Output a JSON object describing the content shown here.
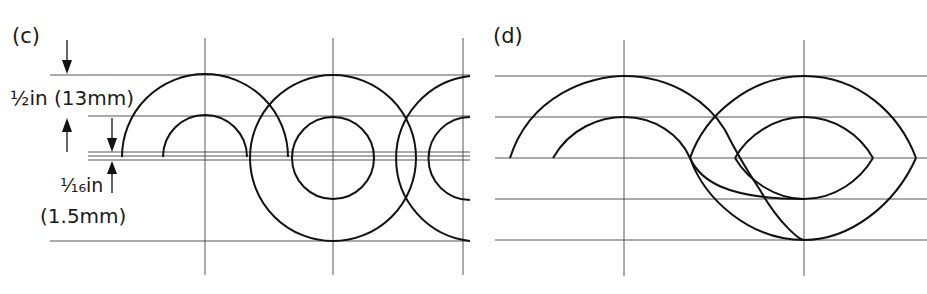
{
  "panels": [
    {
      "id": "c",
      "label": "(c)",
      "dimensions": [
        {
          "label": "½in (13mm)",
          "meaning": "height between guidelines"
        },
        {
          "label_line1": "¹⁄₁₆in",
          "label_line2": "(1.5mm)",
          "meaning": "small gap between baseline lines"
        }
      ],
      "description": "Overlapping circle construction with concentric arcs on ruled guidelines"
    },
    {
      "id": "d",
      "label": "(d)",
      "description": "Two concentric arc sets forming a looped figure with pointed oval ends"
    }
  ],
  "text": {
    "panel_c_label": "(c)",
    "panel_d_label": "(d)",
    "dim_half_inch": "½in (13mm)",
    "dim_sixteenth_a": "¹⁄₁₆in",
    "dim_sixteenth_b": "(1.5mm)"
  },
  "colors": {
    "line": "#111111",
    "grid": "#444444",
    "background": "#ffffff"
  }
}
